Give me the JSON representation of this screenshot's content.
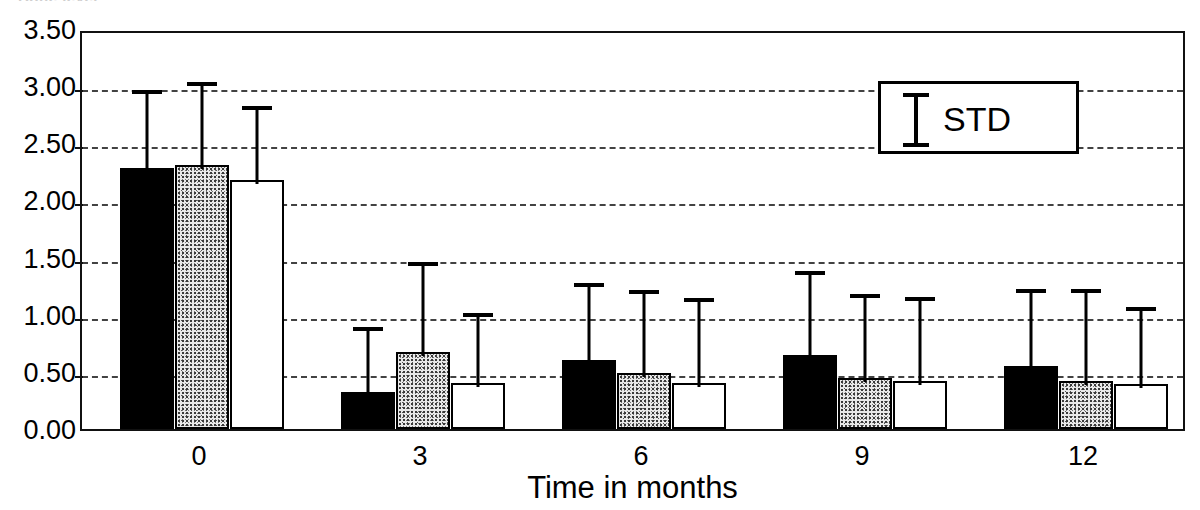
{
  "figure": {
    "clipped_top_text": "Bone level",
    "background_color": "#ffffff",
    "foreground_color": "#000000"
  },
  "legend": {
    "symbol_name": "error-bar-symbol",
    "label": "STD",
    "position": "top-right-inside"
  },
  "axes": {
    "y_ticks": [
      "3.50",
      "3.00",
      "2.50",
      "2.00",
      "1.50",
      "1.00",
      "0.50",
      "0.00"
    ],
    "y_tick_values": [
      3.5,
      3.0,
      2.5,
      2.0,
      1.5,
      1.0,
      0.5,
      0.0
    ],
    "x_ticks": [
      "0",
      "3",
      "6",
      "9",
      "12"
    ],
    "x_title": "Time in months",
    "y_title": ""
  },
  "chart_data": {
    "type": "bar",
    "title": "",
    "subtitle": "",
    "xlabel": "Time in months",
    "ylabel": "",
    "ylim": [
      0.0,
      3.5
    ],
    "ytick_step": 0.5,
    "grid": true,
    "grid_style": "dashed-horizontal",
    "legend": [
      "STD"
    ],
    "legend_position": "top-right-inside",
    "error_bars": "upper-only",
    "categories": [
      "0",
      "3",
      "6",
      "9",
      "12"
    ],
    "series": [
      {
        "name": "series-1",
        "style": "black-filled",
        "color": "#000000",
        "values": [
          2.28,
          0.32,
          0.6,
          0.65,
          0.55
        ],
        "errors_upper": [
          0.72,
          0.61,
          0.71,
          0.77,
          0.71
        ],
        "error_tops": [
          3.0,
          0.93,
          1.31,
          1.42,
          1.26
        ]
      },
      {
        "name": "series-2",
        "style": "gray-stippled",
        "color": "#e9e9e9",
        "values": [
          2.31,
          0.67,
          0.49,
          0.45,
          0.42
        ],
        "errors_upper": [
          0.76,
          0.83,
          0.76,
          0.77,
          0.84
        ],
        "error_tops": [
          3.07,
          1.5,
          1.25,
          1.22,
          1.26
        ]
      },
      {
        "name": "series-3",
        "style": "white-open",
        "color": "#ffffff",
        "values": [
          2.18,
          0.4,
          0.4,
          0.42,
          0.39
        ],
        "errors_upper": [
          0.68,
          0.65,
          0.78,
          0.77,
          0.71
        ],
        "error_tops": [
          2.86,
          1.05,
          1.18,
          1.19,
          1.1
        ]
      }
    ]
  }
}
